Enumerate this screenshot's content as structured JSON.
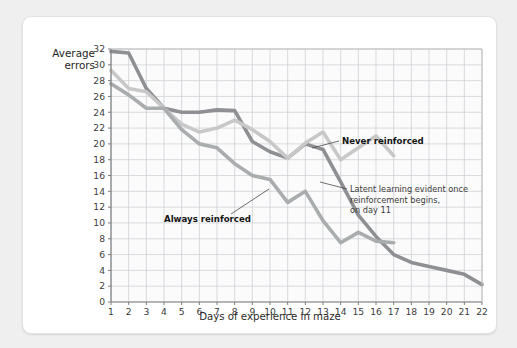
{
  "figure": {
    "background": "#ffffff",
    "page_background": "#efefef"
  },
  "chart_data": {
    "type": "line",
    "title": "",
    "subtitle": "",
    "xlabel": "Days of experience in maze",
    "ylabel": "Average\nerrors",
    "ylabel_line1": "Average",
    "ylabel_line2": "errors",
    "xlim": [
      1,
      22
    ],
    "ylim": [
      0,
      32
    ],
    "ytick_step": 2,
    "grid": true,
    "grid_color": "#c9cdd2",
    "plot_background": "#fbfbfb",
    "legend_position": "inline-annotations",
    "x": [
      1,
      2,
      3,
      4,
      5,
      6,
      7,
      8,
      9,
      10,
      11,
      12,
      13,
      14,
      15,
      16,
      17,
      18,
      19,
      20,
      21,
      22
    ],
    "yticks": [
      0,
      2,
      4,
      6,
      8,
      10,
      12,
      14,
      16,
      18,
      20,
      22,
      24,
      26,
      28,
      30,
      32
    ],
    "xticks": [
      1,
      2,
      3,
      4,
      5,
      6,
      7,
      8,
      9,
      10,
      11,
      12,
      13,
      14,
      15,
      16,
      17,
      18,
      19,
      20,
      21,
      22
    ],
    "series": [
      {
        "name": "Always reinforced",
        "color": "#8f9093",
        "width": 3.6,
        "x": [
          1,
          2,
          3,
          4,
          5,
          6,
          7,
          8,
          9,
          10,
          11,
          12,
          13,
          14,
          15,
          16,
          17,
          18,
          19,
          20,
          21,
          22
        ],
        "values": [
          31.7,
          31.5,
          27.0,
          24.5,
          24.0,
          24.0,
          24.3,
          24.2,
          20.3,
          19.0,
          18.2,
          20.0,
          19.3,
          15.2,
          11.0,
          8.3,
          6.0,
          5.0,
          4.5,
          4.0,
          3.5,
          2.2
        ]
      },
      {
        "name": "Never reinforced",
        "color": "#c8c8c8",
        "width": 3.6,
        "x": [
          1,
          2,
          3,
          4,
          5,
          6,
          7,
          8,
          9,
          10,
          11,
          12,
          13,
          14,
          15,
          16,
          17
        ],
        "values": [
          29.3,
          27.0,
          26.6,
          24.5,
          22.5,
          21.5,
          22.0,
          23.0,
          21.8,
          20.3,
          18.2,
          20.1,
          21.5,
          18.0,
          19.5,
          21.0,
          18.5
        ]
      },
      {
        "name": "Latent learning (no reinforcement until day 11)",
        "color": "#a9adae",
        "width": 3.6,
        "x": [
          1,
          2,
          3,
          4,
          5,
          6,
          7,
          8,
          9,
          10,
          11,
          12,
          13,
          14,
          15,
          16,
          17
        ],
        "values": [
          27.6,
          26.2,
          24.5,
          24.5,
          21.8,
          20.0,
          19.5,
          17.5,
          16.0,
          15.5,
          12.6,
          14.0,
          10.3,
          7.5,
          8.8,
          7.7,
          7.5
        ]
      }
    ],
    "annotations": [
      {
        "id": "never-reinforced",
        "text": "Never reinforced",
        "bold": true,
        "lines": [
          "Never reinforced"
        ],
        "text_x": 319,
        "text_y": 127,
        "leader": "M 316,124 L 289,131"
      },
      {
        "id": "always-reinforced",
        "text": "Always reinforced",
        "bold": true,
        "lines": [
          "Always reinforced"
        ],
        "text_x": 141,
        "text_y": 205,
        "leader": "M 208,197 L 246,172"
      },
      {
        "id": "latent-learning",
        "text": "Latent learning evident once reinforcement begins, on day 11",
        "bold": false,
        "lines": [
          "Latent learning evident once",
          "reinforcement begins,",
          "on day 11"
        ],
        "text_x": 327,
        "text_y": 175,
        "leader": "M 324,172 L 297,165"
      }
    ]
  }
}
